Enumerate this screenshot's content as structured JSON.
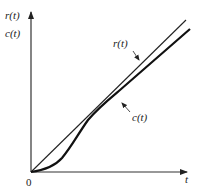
{
  "diagram": {
    "title": "",
    "y_axis_labels": [
      "r(t)",
      "c(t)"
    ],
    "x_axis_label": "t",
    "origin_label": "0",
    "curves": [
      {
        "name": "r(t)",
        "label": "r(t)",
        "style": "thin straight line (ramp input)"
      },
      {
        "name": "c(t)",
        "label": "c(t)",
        "style": "thick S-shaped response lagging ramp"
      }
    ],
    "colors": {
      "line": "#222222",
      "background": "#ffffff"
    }
  }
}
